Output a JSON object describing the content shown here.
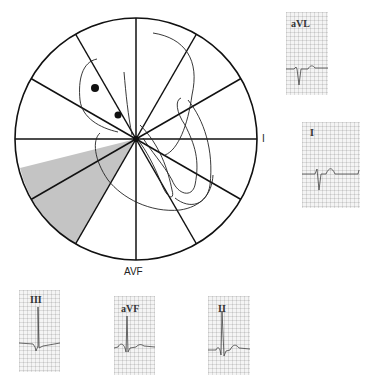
{
  "hexaxial": {
    "center": [
      136,
      139
    ],
    "radius": 121,
    "spoke_angles_deg": [
      0,
      30,
      60,
      90,
      120,
      150
    ],
    "shaded_sector": {
      "from_deg": 166,
      "to_deg": 240,
      "color": "#c4c4c4"
    },
    "labels": {
      "right": "I",
      "bottom": "AVF"
    }
  },
  "leads": [
    {
      "id": "avl",
      "label": "aVL",
      "box": [
        286,
        12,
        42,
        83
      ]
    },
    {
      "id": "i",
      "label": "I",
      "box": [
        302,
        122,
        58,
        86
      ]
    },
    {
      "id": "iii",
      "label": "III",
      "box": [
        19,
        290,
        41,
        82
      ]
    },
    {
      "id": "avf",
      "label": "aVF",
      "box": [
        114,
        296,
        41,
        79
      ]
    },
    {
      "id": "ii",
      "label": "II",
      "box": [
        208,
        296,
        42,
        79
      ]
    }
  ],
  "colors": {
    "line": "#111111",
    "trace": "#444444",
    "shade": "#c4c4c4"
  }
}
